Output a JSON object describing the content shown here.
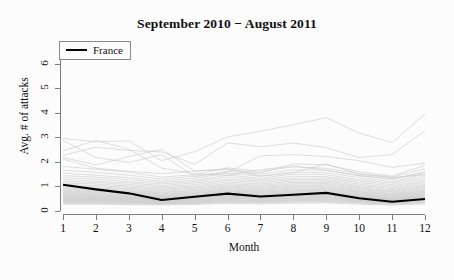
{
  "chart_data": {
    "type": "line",
    "title": "September 2010 − August 2011",
    "xlabel": "Month",
    "ylabel": "Avg. # of attacks",
    "xlim": [
      1,
      12
    ],
    "ylim": [
      0,
      6.4
    ],
    "x": [
      1,
      2,
      3,
      4,
      5,
      6,
      7,
      8,
      9,
      10,
      11,
      12
    ],
    "xticks": [
      "1",
      "2",
      "3",
      "4",
      "5",
      "6",
      "7",
      "8",
      "9",
      "10",
      "11",
      "12"
    ],
    "yticks": [
      "0",
      "1",
      "2",
      "3",
      "4",
      "5",
      "6"
    ],
    "grid": false,
    "legend_position": "top-left",
    "legend": [
      {
        "name": "France",
        "color": "#000000",
        "width": 2.2
      }
    ],
    "highlight_series": {
      "name": "France",
      "color": "#000000",
      "values": [
        1.07,
        0.88,
        0.72,
        0.45,
        0.58,
        0.71,
        0.59,
        0.66,
        0.74,
        0.52,
        0.38,
        0.49
      ]
    },
    "background_series_color": "#c8c8c8",
    "background_series_note": "Other countries plotted as light grey background lines",
    "series": [
      {
        "name": "country-01",
        "values": [
          2.96,
          2.82,
          2.86,
          2.05,
          2.42,
          3.02,
          3.25,
          3.52,
          3.8,
          3.18,
          2.79,
          3.95
        ]
      },
      {
        "name": "country-02",
        "values": [
          2.27,
          2.6,
          2.47,
          2.41,
          1.9,
          2.78,
          2.62,
          2.77,
          2.58,
          2.18,
          2.3,
          3.28
        ]
      },
      {
        "name": "country-03",
        "values": [
          2.88,
          2.18,
          1.98,
          2.3,
          1.4,
          1.58,
          2.25,
          2.3,
          2.22,
          2.05,
          1.78,
          1.95
        ]
      },
      {
        "name": "country-04",
        "values": [
          2.12,
          1.74,
          1.62,
          1.52,
          1.63,
          1.7,
          1.55,
          1.92,
          1.88,
          1.6,
          1.42,
          1.86
        ]
      },
      {
        "name": "country-05",
        "values": [
          1.82,
          1.7,
          1.58,
          1.38,
          1.48,
          1.76,
          1.62,
          1.8,
          1.74,
          1.52,
          1.38,
          1.72
        ]
      },
      {
        "name": "country-06",
        "values": [
          1.66,
          1.58,
          1.46,
          1.3,
          1.42,
          1.62,
          1.5,
          1.68,
          1.66,
          1.44,
          1.28,
          1.6
        ]
      },
      {
        "name": "country-07",
        "values": [
          1.54,
          1.46,
          1.36,
          1.22,
          1.34,
          1.54,
          1.42,
          1.58,
          1.56,
          1.36,
          1.2,
          1.52
        ]
      },
      {
        "name": "country-08",
        "values": [
          1.44,
          1.38,
          1.28,
          1.16,
          1.26,
          1.46,
          1.34,
          1.5,
          1.48,
          1.28,
          1.14,
          1.44
        ]
      },
      {
        "name": "country-09",
        "values": [
          1.36,
          1.3,
          1.2,
          1.1,
          1.2,
          1.38,
          1.28,
          1.42,
          1.4,
          1.22,
          1.08,
          1.36
        ]
      },
      {
        "name": "country-10",
        "values": [
          1.28,
          1.22,
          1.14,
          1.04,
          1.14,
          1.3,
          1.22,
          1.34,
          1.34,
          1.16,
          1.02,
          1.28
        ]
      },
      {
        "name": "country-11",
        "values": [
          1.2,
          1.16,
          1.08,
          0.98,
          1.08,
          1.24,
          1.16,
          1.28,
          1.28,
          1.1,
          0.96,
          1.22
        ]
      },
      {
        "name": "country-12",
        "values": [
          1.14,
          1.1,
          1.02,
          0.94,
          1.02,
          1.18,
          1.1,
          1.22,
          1.22,
          1.04,
          0.92,
          1.16
        ]
      },
      {
        "name": "country-13",
        "values": [
          1.08,
          1.04,
          0.97,
          0.89,
          0.97,
          1.12,
          1.05,
          1.16,
          1.17,
          0.99,
          0.87,
          1.1
        ]
      },
      {
        "name": "country-14",
        "values": [
          1.02,
          0.99,
          0.92,
          0.85,
          0.93,
          1.07,
          1.0,
          1.11,
          1.12,
          0.95,
          0.83,
          1.05
        ]
      },
      {
        "name": "country-15",
        "values": [
          0.97,
          0.94,
          0.88,
          0.81,
          0.88,
          1.02,
          0.96,
          1.06,
          1.07,
          0.91,
          0.79,
          1.0
        ]
      },
      {
        "name": "country-16",
        "values": [
          0.93,
          0.9,
          0.84,
          0.77,
          0.84,
          0.98,
          0.92,
          1.02,
          1.03,
          0.87,
          0.76,
          0.96
        ]
      },
      {
        "name": "country-17",
        "values": [
          0.89,
          0.86,
          0.8,
          0.74,
          0.81,
          0.94,
          0.88,
          0.98,
          0.99,
          0.83,
          0.72,
          0.92
        ]
      },
      {
        "name": "country-18",
        "values": [
          0.85,
          0.82,
          0.77,
          0.71,
          0.77,
          0.9,
          0.84,
          0.94,
          0.95,
          0.8,
          0.69,
          0.88
        ]
      },
      {
        "name": "country-19",
        "values": [
          0.81,
          0.79,
          0.74,
          0.68,
          0.74,
          0.86,
          0.81,
          0.9,
          0.91,
          0.77,
          0.66,
          0.84
        ]
      },
      {
        "name": "country-20",
        "values": [
          0.78,
          0.76,
          0.71,
          0.65,
          0.71,
          0.83,
          0.78,
          0.86,
          0.88,
          0.74,
          0.64,
          0.81
        ]
      },
      {
        "name": "country-21",
        "values": [
          0.75,
          0.73,
          0.68,
          0.63,
          0.68,
          0.8,
          0.75,
          0.83,
          0.84,
          0.71,
          0.61,
          0.78
        ]
      },
      {
        "name": "country-22",
        "values": [
          0.72,
          0.7,
          0.65,
          0.6,
          0.66,
          0.77,
          0.72,
          0.8,
          0.81,
          0.68,
          0.59,
          0.75
        ]
      },
      {
        "name": "country-23",
        "values": [
          0.69,
          0.67,
          0.63,
          0.58,
          0.63,
          0.74,
          0.69,
          0.77,
          0.78,
          0.66,
          0.56,
          0.72
        ]
      },
      {
        "name": "country-24",
        "values": [
          0.66,
          0.65,
          0.6,
          0.56,
          0.61,
          0.71,
          0.67,
          0.74,
          0.75,
          0.63,
          0.54,
          0.69
        ]
      },
      {
        "name": "country-25",
        "values": [
          0.64,
          0.62,
          0.58,
          0.54,
          0.59,
          0.68,
          0.64,
          0.71,
          0.72,
          0.61,
          0.52,
          0.66
        ]
      },
      {
        "name": "country-26",
        "values": [
          0.61,
          0.6,
          0.56,
          0.52,
          0.56,
          0.66,
          0.62,
          0.69,
          0.7,
          0.59,
          0.5,
          0.64
        ]
      },
      {
        "name": "country-27",
        "values": [
          0.59,
          0.58,
          0.54,
          0.5,
          0.54,
          0.63,
          0.59,
          0.66,
          0.67,
          0.57,
          0.48,
          0.61
        ]
      },
      {
        "name": "country-28",
        "values": [
          0.57,
          0.55,
          0.52,
          0.48,
          0.52,
          0.61,
          0.57,
          0.64,
          0.65,
          0.55,
          0.47,
          0.59
        ]
      },
      {
        "name": "country-29",
        "values": [
          0.55,
          0.53,
          0.5,
          0.46,
          0.5,
          0.59,
          0.55,
          0.61,
          0.62,
          0.53,
          0.45,
          0.57
        ]
      },
      {
        "name": "country-30",
        "values": [
          0.52,
          0.51,
          0.48,
          0.44,
          0.48,
          0.56,
          0.53,
          0.59,
          0.6,
          0.51,
          0.43,
          0.55
        ]
      },
      {
        "name": "country-31",
        "values": [
          0.5,
          0.49,
          0.46,
          0.43,
          0.46,
          0.54,
          0.51,
          0.57,
          0.58,
          0.49,
          0.41,
          0.53
        ]
      },
      {
        "name": "country-32",
        "values": [
          0.48,
          0.47,
          0.44,
          0.41,
          0.44,
          0.52,
          0.49,
          0.54,
          0.55,
          0.47,
          0.4,
          0.5
        ]
      },
      {
        "name": "country-33",
        "values": [
          0.46,
          0.45,
          0.42,
          0.39,
          0.42,
          0.5,
          0.47,
          0.52,
          0.53,
          0.45,
          0.38,
          0.48
        ]
      },
      {
        "name": "country-34",
        "values": [
          0.44,
          0.43,
          0.4,
          0.37,
          0.4,
          0.47,
          0.44,
          0.5,
          0.51,
          0.43,
          0.36,
          0.46
        ]
      },
      {
        "name": "country-35",
        "values": [
          0.42,
          0.41,
          0.38,
          0.36,
          0.38,
          0.45,
          0.42,
          0.47,
          0.48,
          0.41,
          0.34,
          0.44
        ]
      },
      {
        "name": "country-36",
        "values": [
          0.4,
          0.39,
          0.36,
          0.34,
          0.36,
          0.43,
          0.4,
          0.45,
          0.46,
          0.39,
          0.33,
          0.42
        ]
      },
      {
        "name": "country-37",
        "values": [
          0.37,
          0.37,
          0.34,
          0.32,
          0.34,
          0.4,
          0.38,
          0.42,
          0.43,
          0.37,
          0.31,
          0.39
        ]
      },
      {
        "name": "country-38",
        "values": [
          0.35,
          0.34,
          0.32,
          0.3,
          0.32,
          0.38,
          0.35,
          0.4,
          0.4,
          0.34,
          0.29,
          0.36
        ]
      },
      {
        "name": "country-39",
        "values": [
          0.32,
          0.31,
          0.29,
          0.28,
          0.3,
          0.35,
          0.33,
          0.36,
          0.37,
          0.32,
          0.27,
          0.33
        ]
      },
      {
        "name": "country-40",
        "values": [
          0.28,
          0.28,
          0.26,
          0.25,
          0.27,
          0.31,
          0.29,
          0.32,
          0.33,
          0.28,
          0.24,
          0.29
        ]
      },
      {
        "name": "country-41",
        "values": [
          2.45,
          2.88,
          2.52,
          1.75,
          1.52,
          1.46,
          1.68,
          1.84,
          1.66,
          1.44,
          1.32,
          1.58
        ]
      },
      {
        "name": "country-42",
        "values": [
          2.18,
          1.88,
          2.22,
          2.52,
          1.62,
          1.72,
          1.42,
          1.56,
          1.92,
          1.5,
          1.36,
          1.48
        ]
      }
    ]
  }
}
